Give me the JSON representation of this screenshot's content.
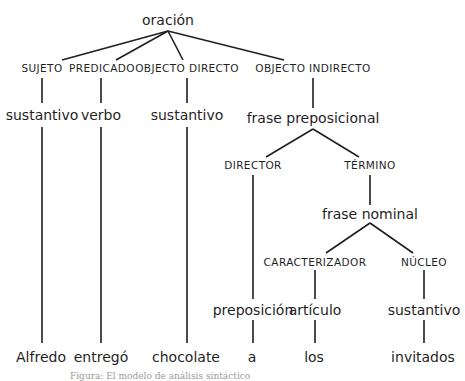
{
  "diagram": {
    "type": "syntax-tree",
    "root": "oración",
    "functions": {
      "sujeto": "SUJETO",
      "predicado": "PREDICADO",
      "objeto_directo": "OBJECTO DIRECTO",
      "objeto_indirecto": "OBJECTO INDIRECTO",
      "director": "DIRECTOR",
      "termino": "TÉRMINO",
      "caracterizador": "CARACTERIZADOR",
      "nucleo": "NÚCLEO"
    },
    "categories": {
      "sujeto_cat": "sustantivo",
      "predicado_cat": "verbo",
      "od_cat": "sustantivo",
      "oi_cat": "frase preposicional",
      "termino_cat": "frase nominal",
      "director_cat": "preposición",
      "caracterizador_cat": "artículo",
      "nucleo_cat": "sustantivo"
    },
    "words": [
      "Alfredo",
      "entregó",
      "chocolate",
      "a",
      "los",
      "invitados"
    ]
  },
  "caption": "Figura: El modelo de análisis sintáctico"
}
